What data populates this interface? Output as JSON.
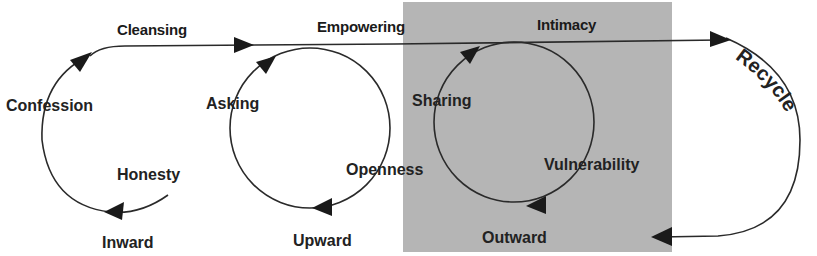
{
  "colors": {
    "background": "#ffffff",
    "highlight_box": "#b5b5b5",
    "stroke": "#2a2a2a",
    "text": "#222222"
  },
  "stages": [
    {
      "label": "Cleansing"
    },
    {
      "label": "Empowering"
    },
    {
      "label": "Intimacy",
      "highlighted": true
    }
  ],
  "cycles": [
    {
      "name": "cleansing",
      "steps": [
        "Confession",
        "Honesty"
      ],
      "direction": "Inward"
    },
    {
      "name": "empowering",
      "steps": [
        "Asking",
        "Openness"
      ],
      "direction": "Upward"
    },
    {
      "name": "intimacy",
      "steps": [
        "Sharing",
        "Vulnerability"
      ],
      "direction": "Outward"
    }
  ],
  "return_loop": {
    "label": "Recycle"
  }
}
